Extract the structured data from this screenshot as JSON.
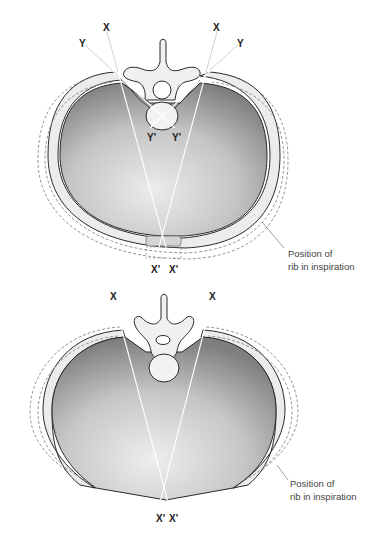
{
  "figures": [
    {
      "id": "top",
      "description": "Transverse section of thorax - upper rib (bucket handle / pump handle axes)",
      "axis_labels": {
        "x_left": "X",
        "x_right": "X",
        "y_left": "Y",
        "y_right": "Y",
        "y_prime_left": "Y'",
        "y_prime_right": "Y'",
        "x_prime_left": "X'",
        "x_prime_right": "X'"
      },
      "caption": {
        "line1": "Position of",
        "line2": "rib in inspiration"
      }
    },
    {
      "id": "bottom",
      "description": "Transverse section of thorax - lower rib",
      "axis_labels": {
        "x_left": "X",
        "x_right": "X",
        "x_prime_left": "X'",
        "x_prime_right": "X'"
      },
      "caption": {
        "line1": "Position of",
        "line2": "rib in inspiration"
      }
    }
  ],
  "colors": {
    "lung_dark": "#8a8a8a",
    "lung_light": "#e6e6e6",
    "rib_fill": "#ececec",
    "bone_fill": "#f2f2f2",
    "outline": "#2a2a2a",
    "dashed": "#888888",
    "axis_line": "#ffffff"
  }
}
